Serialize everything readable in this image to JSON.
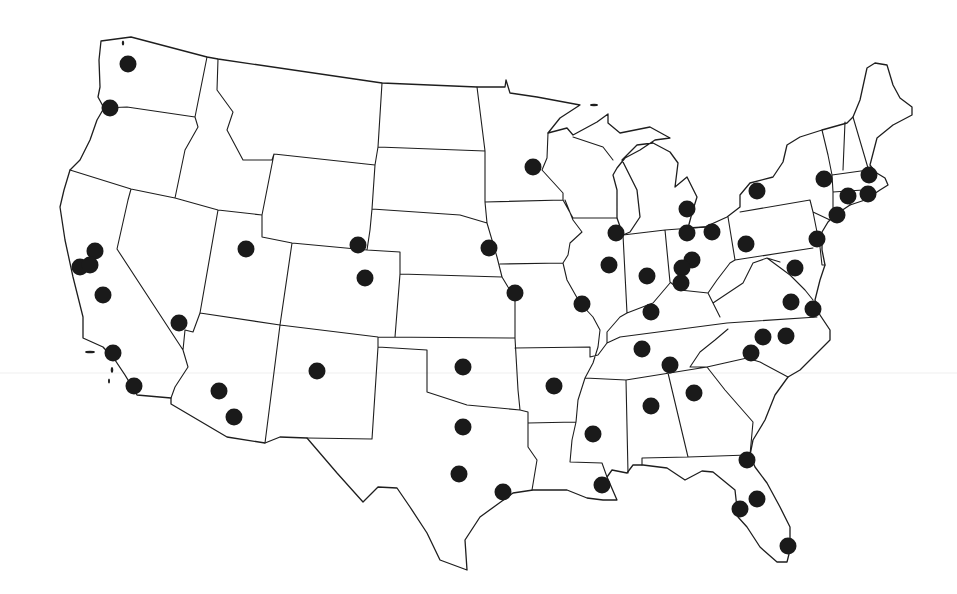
{
  "map": {
    "region": "contiguous-united-states",
    "background_color": "#ffffff",
    "border_color": "#1e1e1e",
    "marker_color": "#1a1a1a",
    "marker_radius": 8.5
  },
  "markers": [
    {
      "x": 128,
      "y": 64
    },
    {
      "x": 110,
      "y": 108
    },
    {
      "x": 95,
      "y": 251
    },
    {
      "x": 80,
      "y": 267
    },
    {
      "x": 90,
      "y": 265
    },
    {
      "x": 103,
      "y": 295
    },
    {
      "x": 179,
      "y": 323
    },
    {
      "x": 113,
      "y": 353
    },
    {
      "x": 134,
      "y": 386
    },
    {
      "x": 246,
      "y": 249
    },
    {
      "x": 219,
      "y": 391
    },
    {
      "x": 234,
      "y": 417
    },
    {
      "x": 358,
      "y": 245
    },
    {
      "x": 365,
      "y": 278
    },
    {
      "x": 317,
      "y": 371
    },
    {
      "x": 463,
      "y": 367
    },
    {
      "x": 463,
      "y": 427
    },
    {
      "x": 459,
      "y": 474
    },
    {
      "x": 503,
      "y": 492
    },
    {
      "x": 489,
      "y": 248
    },
    {
      "x": 515,
      "y": 293
    },
    {
      "x": 533,
      "y": 167
    },
    {
      "x": 554,
      "y": 386
    },
    {
      "x": 593,
      "y": 434
    },
    {
      "x": 602,
      "y": 485
    },
    {
      "x": 642,
      "y": 349
    },
    {
      "x": 670,
      "y": 365
    },
    {
      "x": 651,
      "y": 406
    },
    {
      "x": 694,
      "y": 393
    },
    {
      "x": 582,
      "y": 304
    },
    {
      "x": 616,
      "y": 233
    },
    {
      "x": 609,
      "y": 265
    },
    {
      "x": 647,
      "y": 276
    },
    {
      "x": 651,
      "y": 312
    },
    {
      "x": 687,
      "y": 209
    },
    {
      "x": 687,
      "y": 233
    },
    {
      "x": 712,
      "y": 232
    },
    {
      "x": 692,
      "y": 260
    },
    {
      "x": 682,
      "y": 268
    },
    {
      "x": 681,
      "y": 283
    },
    {
      "x": 746,
      "y": 244
    },
    {
      "x": 757,
      "y": 191
    },
    {
      "x": 824,
      "y": 179
    },
    {
      "x": 869,
      "y": 175
    },
    {
      "x": 848,
      "y": 196
    },
    {
      "x": 868,
      "y": 194
    },
    {
      "x": 837,
      "y": 215
    },
    {
      "x": 817,
      "y": 239
    },
    {
      "x": 795,
      "y": 268
    },
    {
      "x": 791,
      "y": 302
    },
    {
      "x": 813,
      "y": 309
    },
    {
      "x": 763,
      "y": 337
    },
    {
      "x": 786,
      "y": 336
    },
    {
      "x": 751,
      "y": 353
    },
    {
      "x": 747,
      "y": 460
    },
    {
      "x": 757,
      "y": 499
    },
    {
      "x": 740,
      "y": 509
    },
    {
      "x": 788,
      "y": 546
    }
  ],
  "marker_count": 58
}
